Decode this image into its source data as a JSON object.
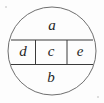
{
  "figure": {
    "name": "circle-band-diagram",
    "background_color": "#fdfdfd",
    "circle_stroke_color": "#6f6f6f",
    "band_stroke_color": "#3b3b3b",
    "label_color": "#262626",
    "circle": {
      "center_x": 52,
      "center_y": 51,
      "radius": 44
    },
    "band": {
      "top_y": 40,
      "bottom_y": 64.5,
      "left_x": 11,
      "right_x": 93,
      "divider_x_1": 35.5,
      "divider_x_2": 67
    },
    "regions": [
      {
        "id": "a",
        "label": "a",
        "position": "top",
        "x": 52,
        "y": 26
      },
      {
        "id": "d",
        "label": "d",
        "position": "band-left",
        "x": 23,
        "y": 52.5
      },
      {
        "id": "c",
        "label": "c",
        "position": "band-center",
        "x": 51,
        "y": 52.5
      },
      {
        "id": "e",
        "label": "e",
        "position": "band-right",
        "x": 80,
        "y": 52.5
      },
      {
        "id": "b",
        "label": "b",
        "position": "bottom",
        "x": 51,
        "y": 78
      }
    ],
    "label_font_size": 15
  }
}
